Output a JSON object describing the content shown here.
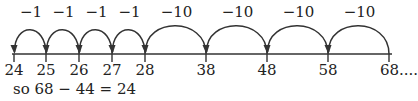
{
  "number_line": {
    "ticks": [
      {
        "value": "24",
        "x": 14
      },
      {
        "value": "25",
        "x": 46
      },
      {
        "value": "26",
        "x": 79
      },
      {
        "value": "27",
        "x": 112
      },
      {
        "value": "28",
        "x": 145
      },
      {
        "value": "38",
        "x": 206
      },
      {
        "value": "48",
        "x": 267
      },
      {
        "value": "58",
        "x": 328
      },
      {
        "value": "68....",
        "x": 389
      }
    ],
    "jumps": [
      {
        "label": "−1",
        "from": "25",
        "to": "24"
      },
      {
        "label": "−1",
        "from": "26",
        "to": "25"
      },
      {
        "label": "−1",
        "from": "27",
        "to": "26"
      },
      {
        "label": "−1",
        "from": "28",
        "to": "27"
      },
      {
        "label": "−10",
        "from": "38",
        "to": "28"
      },
      {
        "label": "−10",
        "from": "48",
        "to": "38"
      },
      {
        "label": "−10",
        "from": "58",
        "to": "48"
      },
      {
        "label": "−10",
        "from": "68",
        "to": "58"
      }
    ]
  },
  "conclusion": "so 68 − 44 = 24"
}
